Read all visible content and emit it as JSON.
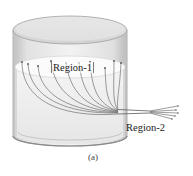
{
  "figure": {
    "type": "cylinder-with-fiber-bundle",
    "labels": {
      "region1": "Region-1",
      "region2": "Region-2"
    },
    "caption": "(a)",
    "fiber_count": 10,
    "colors": {
      "cylinder_wall": "#d6d6d6",
      "cylinder_top": "#e4e4e4",
      "liquid_surface": "#f7f7f7",
      "fiber_line": "#555555",
      "text": "#222222"
    }
  }
}
